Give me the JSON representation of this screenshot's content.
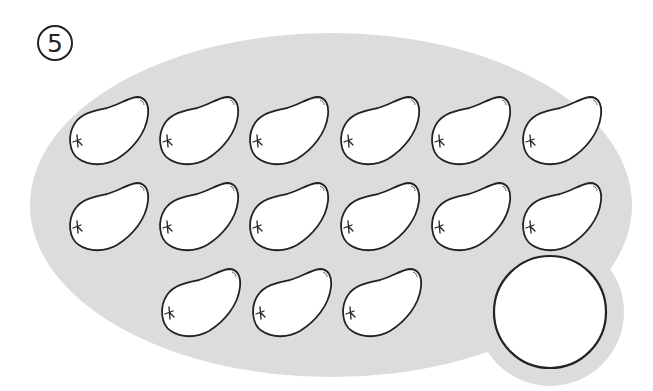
{
  "worksheet": {
    "problem_number": "5",
    "region_fill": "#dcdcdc",
    "outline_color": "#222222",
    "item_fill": "#ffffff",
    "item_icon": "mango-icon",
    "item_count": 15,
    "rows": [
      {
        "y": 97,
        "x": [
          67,
          157,
          247,
          338,
          429,
          520
        ]
      },
      {
        "y": 183,
        "x": [
          67,
          157,
          247,
          338,
          429,
          520
        ]
      },
      {
        "y": 269,
        "x": [
          159,
          250,
          340
        ]
      }
    ],
    "answer_box": {
      "cx": 550,
      "cy": 312,
      "r": 56,
      "value": ""
    }
  }
}
